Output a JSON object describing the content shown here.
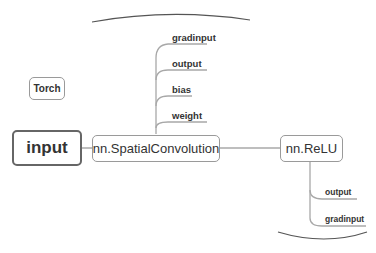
{
  "diagram": {
    "floating_topic": {
      "label": "Torch"
    },
    "root": {
      "label": "input"
    },
    "nodes": [
      {
        "id": "spatial-convolution",
        "label": "nn.SpatialConvolution"
      },
      {
        "id": "relu",
        "label": "nn.ReLU"
      }
    ],
    "spatial_convolution_children": [
      {
        "label": "gradinput"
      },
      {
        "label": "output"
      },
      {
        "label": "bias"
      },
      {
        "label": "weight"
      }
    ],
    "relu_children": [
      {
        "label": "output"
      },
      {
        "label": "gradinput"
      }
    ],
    "colors": {
      "line": "#a8a8a8",
      "node_border": "#9a9a9a",
      "root_border": "#666666",
      "text": "#333333"
    }
  }
}
